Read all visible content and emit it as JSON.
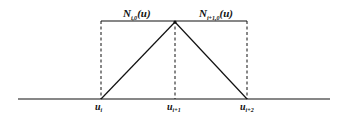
{
  "diagram": {
    "type": "b-spline-basis-functions",
    "colors": {
      "line": "#111111",
      "background": "#ffffff"
    },
    "top_labels": [
      {
        "main": "N",
        "sub": "i,0",
        "arg": "(u)"
      },
      {
        "main": "N",
        "sub": "i+1,0",
        "arg": "(u)"
      }
    ],
    "knots": [
      {
        "main": "u",
        "sub": "i"
      },
      {
        "main": "u",
        "sub": "i+1"
      },
      {
        "main": "u",
        "sub": "i+2"
      }
    ]
  }
}
